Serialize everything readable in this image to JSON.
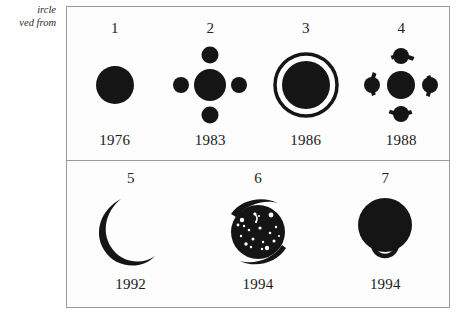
{
  "margin_caption": {
    "line1": "ircle",
    "line2": "ved from"
  },
  "figure": {
    "ink_color": "#151515",
    "frame_color": "#9a9a9a",
    "background_color": "#fdfdfd",
    "panels": [
      {
        "name": "top-panel",
        "items": [
          {
            "index": "1",
            "year": "1976",
            "icon": "solid-disk-icon"
          },
          {
            "index": "2",
            "year": "1983",
            "icon": "disk-with-four-satellites-icon"
          },
          {
            "index": "3",
            "year": "1986",
            "icon": "disk-in-ring-icon"
          },
          {
            "index": "4",
            "year": "1988",
            "icon": "disk-with-satellites-on-dashed-orbit-icon"
          }
        ]
      },
      {
        "name": "bottom-panel",
        "items": [
          {
            "index": "5",
            "year": "1992",
            "icon": "crescent-icon"
          },
          {
            "index": "6",
            "year": "1994",
            "icon": "speckled-disk-with-swoosh-icon"
          },
          {
            "index": "7",
            "year": "1994",
            "icon": "disk-with-loop-icon"
          }
        ]
      }
    ]
  }
}
